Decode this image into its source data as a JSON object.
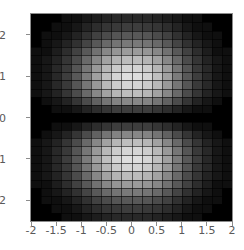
{
  "figure": {
    "type": "density-plot",
    "width": 244,
    "height": 250,
    "background_color": "#ffffff",
    "frame_color": "#8c8c8c",
    "tick_label_color": "#5a5a5a"
  },
  "chart_data": {
    "type": "heatmap",
    "title": "",
    "subtitle": "",
    "xlabel": "",
    "ylabel": "",
    "colormap": "grayscale",
    "colormap_low": "#000000",
    "colormap_high": "#ffffff",
    "grid": true,
    "grid_color": "#2b2b2b",
    "legend": "none",
    "xlim": [
      -2,
      2
    ],
    "ylim": [
      -2.5,
      2.5
    ],
    "n_cols": 20,
    "n_cells_x": 20,
    "n_cells_y": 25,
    "cell_width_units": 0.2,
    "cell_height_units": 0.2,
    "xticks": [
      -2,
      -1.5,
      -1,
      -0.5,
      0,
      0.5,
      1,
      1.5,
      2
    ],
    "xticklabels": [
      "-2",
      "-1.5",
      "-1",
      "-0.5",
      "0",
      "0.5",
      "1",
      "1.5",
      "2"
    ],
    "yticks": [
      2,
      1,
      0,
      -1,
      -2
    ],
    "yticklabels": [
      "2",
      "1",
      "0",
      "-1",
      "-2"
    ],
    "xtick_minor_step": 0.1,
    "ytick_minor_step": 0.1,
    "function": "y^2 * exp(-(x^2 + y^2))",
    "zmin": 0,
    "zmax": 1,
    "peaks": [
      {
        "x": 0,
        "y": 1.1,
        "z": 1.0
      },
      {
        "x": 0,
        "y": -1.1,
        "z": 1.0
      }
    ],
    "nodal_line": {
      "axis": "y",
      "value": 0,
      "z": 0
    },
    "x_centers": [
      -1.9,
      -1.7,
      -1.5,
      -1.3,
      -1.1,
      -0.9,
      -0.7,
      -0.5,
      -0.3,
      -0.1,
      0.1,
      0.3,
      0.5,
      0.7,
      0.9,
      1.1,
      1.3,
      1.5,
      1.7,
      1.9
    ],
    "y_centers": [
      2.4,
      2.2,
      2.0,
      1.8,
      1.6,
      1.4,
      1.2,
      1.0,
      0.8,
      0.6,
      0.4,
      0.2,
      0.0,
      -0.2,
      -0.4,
      -0.6,
      -0.8,
      -1.0,
      -1.2,
      -1.4,
      -1.6,
      -1.8,
      -2.0,
      -2.2,
      -2.4
    ],
    "values": [
      [
        0.0,
        0.0,
        0.0,
        0.01,
        0.01,
        0.02,
        0.03,
        0.04,
        0.05,
        0.05,
        0.05,
        0.05,
        0.04,
        0.03,
        0.02,
        0.01,
        0.01,
        0.0,
        0.0,
        0.0
      ],
      [
        0.0,
        0.0,
        0.01,
        0.01,
        0.02,
        0.04,
        0.06,
        0.08,
        0.09,
        0.1,
        0.1,
        0.09,
        0.08,
        0.06,
        0.04,
        0.02,
        0.01,
        0.01,
        0.0,
        0.0
      ],
      [
        0.0,
        0.01,
        0.01,
        0.02,
        0.04,
        0.07,
        0.11,
        0.14,
        0.17,
        0.18,
        0.18,
        0.17,
        0.14,
        0.11,
        0.07,
        0.04,
        0.02,
        0.01,
        0.01,
        0.0
      ],
      [
        0.0,
        0.01,
        0.02,
        0.04,
        0.07,
        0.12,
        0.18,
        0.24,
        0.28,
        0.3,
        0.3,
        0.28,
        0.24,
        0.18,
        0.12,
        0.07,
        0.04,
        0.02,
        0.01,
        0.0
      ],
      [
        0.01,
        0.01,
        0.03,
        0.06,
        0.11,
        0.18,
        0.27,
        0.36,
        0.42,
        0.45,
        0.45,
        0.42,
        0.36,
        0.27,
        0.18,
        0.11,
        0.06,
        0.03,
        0.01,
        0.01
      ],
      [
        0.01,
        0.02,
        0.04,
        0.08,
        0.14,
        0.24,
        0.36,
        0.48,
        0.57,
        0.61,
        0.61,
        0.57,
        0.48,
        0.36,
        0.24,
        0.14,
        0.08,
        0.04,
        0.02,
        0.01
      ],
      [
        0.01,
        0.02,
        0.05,
        0.09,
        0.17,
        0.29,
        0.44,
        0.58,
        0.69,
        0.74,
        0.74,
        0.69,
        0.58,
        0.44,
        0.29,
        0.17,
        0.09,
        0.05,
        0.02,
        0.01
      ],
      [
        0.01,
        0.02,
        0.05,
        0.1,
        0.18,
        0.31,
        0.47,
        0.63,
        0.75,
        0.8,
        0.8,
        0.75,
        0.63,
        0.47,
        0.31,
        0.18,
        0.1,
        0.05,
        0.02,
        0.01
      ],
      [
        0.01,
        0.02,
        0.05,
        0.09,
        0.17,
        0.29,
        0.44,
        0.59,
        0.7,
        0.75,
        0.75,
        0.7,
        0.59,
        0.44,
        0.29,
        0.17,
        0.09,
        0.05,
        0.02,
        0.01
      ],
      [
        0.01,
        0.02,
        0.04,
        0.08,
        0.14,
        0.24,
        0.36,
        0.48,
        0.58,
        0.62,
        0.62,
        0.58,
        0.48,
        0.36,
        0.24,
        0.14,
        0.08,
        0.04,
        0.02,
        0.01
      ],
      [
        0.0,
        0.01,
        0.02,
        0.04,
        0.08,
        0.14,
        0.21,
        0.28,
        0.34,
        0.36,
        0.36,
        0.34,
        0.28,
        0.21,
        0.14,
        0.08,
        0.04,
        0.02,
        0.01,
        0.0
      ],
      [
        0.0,
        0.0,
        0.01,
        0.01,
        0.02,
        0.04,
        0.06,
        0.08,
        0.1,
        0.1,
        0.1,
        0.1,
        0.08,
        0.06,
        0.04,
        0.02,
        0.01,
        0.01,
        0.0,
        0.0
      ],
      [
        0.0,
        0.0,
        0.0,
        0.0,
        0.0,
        0.0,
        0.0,
        0.0,
        0.0,
        0.0,
        0.0,
        0.0,
        0.0,
        0.0,
        0.0,
        0.0,
        0.0,
        0.0,
        0.0,
        0.0
      ],
      [
        0.0,
        0.0,
        0.01,
        0.01,
        0.02,
        0.04,
        0.06,
        0.08,
        0.1,
        0.1,
        0.1,
        0.1,
        0.08,
        0.06,
        0.04,
        0.02,
        0.01,
        0.01,
        0.0,
        0.0
      ],
      [
        0.0,
        0.01,
        0.02,
        0.04,
        0.08,
        0.14,
        0.21,
        0.28,
        0.34,
        0.36,
        0.36,
        0.34,
        0.28,
        0.21,
        0.14,
        0.08,
        0.04,
        0.02,
        0.01,
        0.0
      ],
      [
        0.01,
        0.02,
        0.04,
        0.08,
        0.14,
        0.24,
        0.36,
        0.48,
        0.58,
        0.62,
        0.62,
        0.58,
        0.48,
        0.36,
        0.24,
        0.14,
        0.08,
        0.04,
        0.02,
        0.01
      ],
      [
        0.01,
        0.02,
        0.05,
        0.09,
        0.17,
        0.29,
        0.44,
        0.59,
        0.7,
        0.75,
        0.75,
        0.7,
        0.59,
        0.44,
        0.29,
        0.17,
        0.09,
        0.05,
        0.02,
        0.01
      ],
      [
        0.01,
        0.02,
        0.05,
        0.1,
        0.18,
        0.31,
        0.47,
        0.63,
        0.75,
        0.8,
        0.8,
        0.75,
        0.63,
        0.47,
        0.31,
        0.18,
        0.1,
        0.05,
        0.02,
        0.01
      ],
      [
        0.01,
        0.02,
        0.05,
        0.09,
        0.17,
        0.29,
        0.44,
        0.58,
        0.69,
        0.74,
        0.74,
        0.69,
        0.58,
        0.44,
        0.29,
        0.17,
        0.09,
        0.05,
        0.02,
        0.01
      ],
      [
        0.01,
        0.02,
        0.04,
        0.08,
        0.14,
        0.24,
        0.36,
        0.48,
        0.57,
        0.61,
        0.61,
        0.57,
        0.48,
        0.36,
        0.24,
        0.14,
        0.08,
        0.04,
        0.02,
        0.01
      ],
      [
        0.01,
        0.01,
        0.03,
        0.06,
        0.11,
        0.18,
        0.27,
        0.36,
        0.42,
        0.45,
        0.45,
        0.42,
        0.36,
        0.27,
        0.18,
        0.11,
        0.06,
        0.03,
        0.01,
        0.01
      ],
      [
        0.0,
        0.01,
        0.02,
        0.04,
        0.07,
        0.12,
        0.18,
        0.24,
        0.28,
        0.3,
        0.3,
        0.28,
        0.24,
        0.18,
        0.12,
        0.07,
        0.04,
        0.02,
        0.01,
        0.0
      ],
      [
        0.0,
        0.01,
        0.01,
        0.02,
        0.04,
        0.07,
        0.11,
        0.14,
        0.17,
        0.18,
        0.18,
        0.17,
        0.14,
        0.11,
        0.07,
        0.04,
        0.02,
        0.01,
        0.01,
        0.0
      ],
      [
        0.0,
        0.0,
        0.01,
        0.01,
        0.02,
        0.04,
        0.06,
        0.08,
        0.09,
        0.1,
        0.1,
        0.09,
        0.08,
        0.06,
        0.04,
        0.02,
        0.01,
        0.01,
        0.0,
        0.0
      ],
      [
        0.0,
        0.0,
        0.0,
        0.01,
        0.01,
        0.02,
        0.03,
        0.04,
        0.05,
        0.05,
        0.05,
        0.05,
        0.04,
        0.03,
        0.02,
        0.01,
        0.01,
        0.0,
        0.0,
        0.0
      ]
    ]
  }
}
